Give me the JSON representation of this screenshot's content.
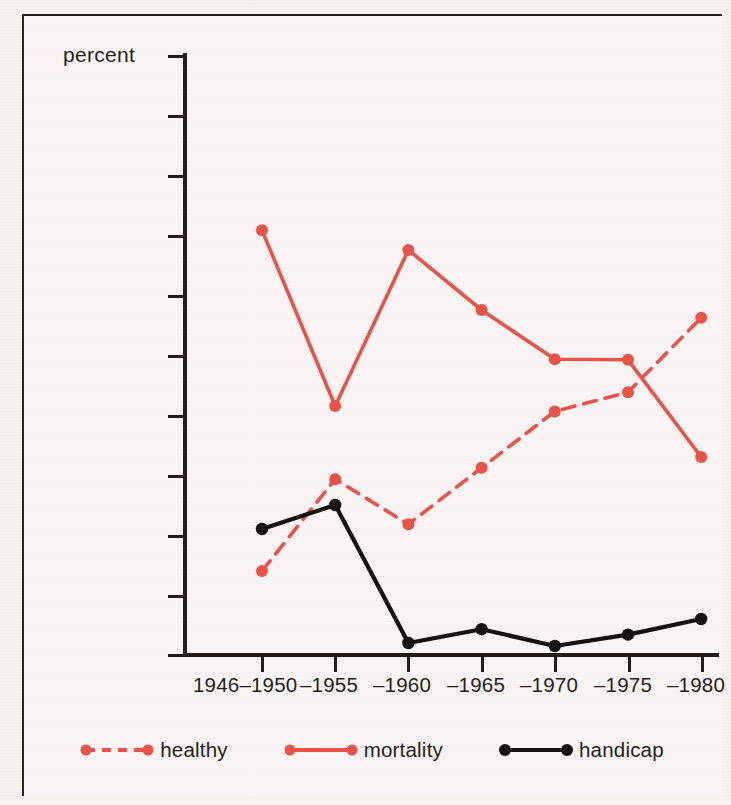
{
  "chart_data": {
    "type": "line",
    "title": "",
    "subtitle": "",
    "xlabel": "",
    "ylabel": "percent",
    "ylim": [
      0,
      100
    ],
    "yticks": [
      0,
      10,
      20,
      30,
      40,
      50,
      60,
      70,
      80,
      90,
      100
    ],
    "ytick_labels": [
      "0",
      "10",
      "20",
      "30",
      "40",
      "50",
      "60",
      "70",
      "80",
      "90",
      "100"
    ],
    "grid": false,
    "legend_position": "bottom",
    "categories": [
      "1946–1950",
      "–1955",
      "–1960",
      "–1965",
      "–1970",
      "–1975",
      "–1980"
    ],
    "series": [
      {
        "name": "healthy",
        "color": "#e8534a",
        "style": "dashed",
        "marker": "circle",
        "values": [
          14,
          29.3,
          21.8,
          31.2,
          40.6,
          43.8,
          56.2
        ]
      },
      {
        "name": "mortality",
        "color": "#e8534a",
        "style": "solid",
        "marker": "circle",
        "values": [
          70.8,
          41.5,
          67.5,
          57.5,
          49.3,
          49.2,
          33
        ]
      },
      {
        "name": "handicap",
        "color": "#151110",
        "style": "solid",
        "marker": "circle",
        "values": [
          21,
          25,
          2,
          4.3,
          1.5,
          3.4,
          6
        ]
      }
    ]
  },
  "axes": {
    "y_axis_title": "percent",
    "y_tick_labels": [
      "100",
      "90",
      "80",
      "70",
      "60",
      "50",
      "40",
      "30",
      "20",
      "10",
      "0"
    ],
    "x_tick_labels": [
      "1946–1950",
      "–1955",
      "–1960",
      "–1965",
      "–1970",
      "–1975",
      "–1980"
    ]
  },
  "legend": {
    "items": [
      {
        "label": "healthy",
        "color": "#e8534a",
        "style": "dashed"
      },
      {
        "label": "mortality",
        "color": "#e8534a",
        "style": "solid"
      },
      {
        "label": "handicap",
        "color": "#151110",
        "style": "solid"
      }
    ]
  },
  "colors": {
    "background": "#f7f1f0",
    "panel": "#faf5f4",
    "axis": "#221b19",
    "red_series": "#e8534a",
    "black_series": "#151110",
    "text": "#241d1b"
  }
}
